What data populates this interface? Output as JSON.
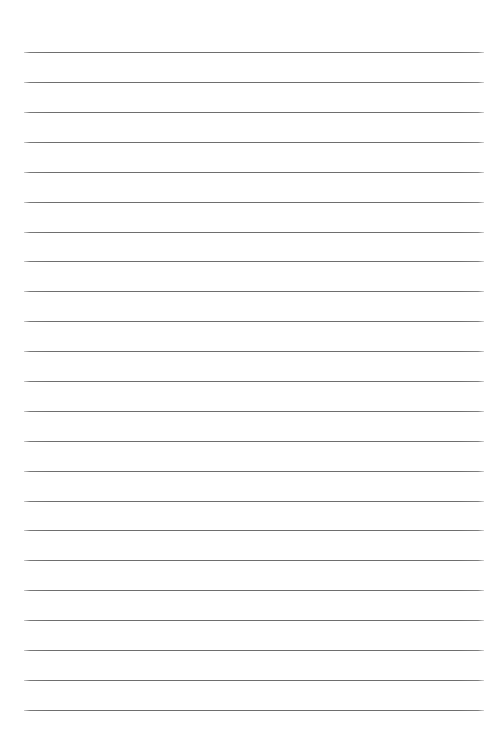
{
  "document": {
    "kind": "ruled-notepaper",
    "title": "",
    "body_text": "",
    "page_number": "",
    "background_color": "#ffffff",
    "is_blank": "true"
  },
  "ruling": {
    "line_color": "#6e6e6e",
    "line_thickness_px": 1,
    "line_count": 23,
    "left_margin_px": 24,
    "right_edge_px": 484,
    "line_width_px": 460,
    "first_line_y_px": 52,
    "last_line_y_px": 710,
    "line_spacing_px": 29.9,
    "top_margin_px": 52,
    "bottom_margin_px": 45,
    "line_y_positions": [
      52,
      82,
      112,
      142,
      172,
      202,
      232,
      261,
      291,
      321,
      351,
      381,
      411,
      441,
      471,
      501,
      530,
      560,
      590,
      620,
      650,
      680,
      710
    ]
  },
  "canvas": {
    "width_px": 504,
    "height_px": 755
  }
}
